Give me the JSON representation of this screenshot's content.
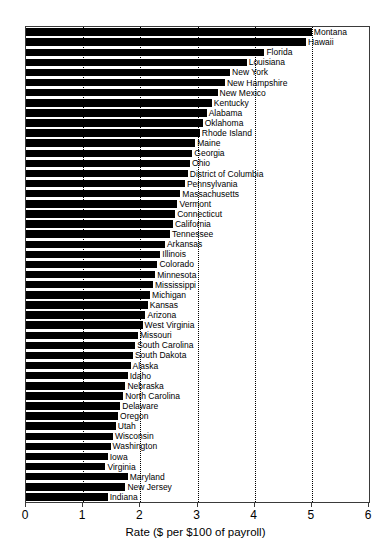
{
  "chart_data": {
    "type": "bar",
    "orientation": "horizontal",
    "title": "",
    "xlabel": "Rate ($ per $100 of payroll)",
    "ylabel": "",
    "xlim": [
      0,
      6
    ],
    "xticks": [
      0,
      1,
      2,
      3,
      4,
      5,
      6
    ],
    "xtick_labels": [
      "0",
      "1",
      "2",
      "3",
      "4",
      "5",
      "6"
    ],
    "grid": "vertical-dotted",
    "legend": "none",
    "bar_color": "#000000",
    "categories": [
      "Montana",
      "Hawaii",
      "Florida",
      "Louisiana",
      "New York",
      "New Hampshire",
      "New Mexico",
      "Kentucky",
      "Alabama",
      "Oklahoma",
      "Rhode Island",
      "Maine",
      "Georgia",
      "Ohio",
      "District of Columbia",
      "Pennsylvania",
      "Massachusetts",
      "Vermont",
      "Connecticut",
      "California",
      "Tennessee",
      "Arkansas",
      "Illinois",
      "Colorado",
      "Minnesota",
      "Mississippi",
      "Michigan",
      "Kansas",
      "Arizona",
      "West Virginia",
      "Missouri",
      "South Carolina",
      "South Dakota",
      "Alaska",
      "Idaho",
      "Nebraska",
      "North Carolina",
      "Delaware",
      "Oregon",
      "Utah",
      "Wisconsin",
      "Washington",
      "Iowa",
      "Virginia",
      "Maryland",
      "New Jersey",
      "Indiana"
    ],
    "values": [
      5.0,
      4.9,
      4.17,
      3.86,
      3.57,
      3.48,
      3.35,
      3.25,
      3.16,
      3.09,
      3.04,
      2.96,
      2.91,
      2.87,
      2.83,
      2.78,
      2.7,
      2.65,
      2.61,
      2.57,
      2.52,
      2.43,
      2.35,
      2.3,
      2.26,
      2.22,
      2.17,
      2.13,
      2.09,
      2.04,
      1.96,
      1.91,
      1.87,
      1.83,
      1.78,
      1.74,
      1.7,
      1.65,
      1.61,
      1.57,
      1.52,
      1.48,
      1.43,
      1.39,
      1.78,
      1.74,
      1.43
    ]
  }
}
